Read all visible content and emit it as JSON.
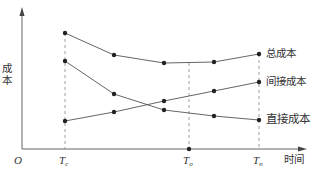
{
  "chart_data": {
    "type": "line",
    "title": "",
    "xlabel": "时间",
    "ylabel": "成本",
    "origin_label": "O",
    "x_ticks": [
      {
        "label": "T",
        "sub": "c",
        "x": 65
      },
      {
        "label": "T",
        "sub": "o",
        "x": 189
      },
      {
        "label": "T",
        "sub": "n",
        "x": 259
      }
    ],
    "grid": false,
    "legend_position": "inline-right",
    "x": [
      65,
      114,
      164,
      214,
      259
    ],
    "series": [
      {
        "name": "总成本",
        "values": [
          141,
          119,
          111,
          112,
          120
        ]
      },
      {
        "name": "间接成本",
        "values": [
          53,
          62,
          73,
          83,
          92
        ]
      },
      {
        "name": "直接成本",
        "values": [
          113,
          80,
          64,
          58,
          54
        ]
      }
    ],
    "pixel_points": {
      "total": [
        [
          65,
          33
        ],
        [
          114,
          55
        ],
        [
          164,
          63
        ],
        [
          214,
          62
        ],
        [
          259,
          54
        ]
      ],
      "indirect": [
        [
          65,
          121
        ],
        [
          114,
          112
        ],
        [
          164,
          101
        ],
        [
          214,
          91
        ],
        [
          259,
          82
        ]
      ],
      "direct": [
        [
          65,
          61
        ],
        [
          114,
          94
        ],
        [
          164,
          110
        ],
        [
          214,
          116
        ],
        [
          259,
          120
        ]
      ]
    }
  },
  "labels": {
    "total": "总成本",
    "indirect": "间接成本",
    "direct": "直接成本",
    "xlabel": "时间",
    "ylabel_chars": [
      "成",
      "本"
    ],
    "origin": "O",
    "tc": {
      "main": "T",
      "sub": "c"
    },
    "to": {
      "main": "T",
      "sub": "o"
    },
    "tn": {
      "main": "T",
      "sub": "n"
    }
  },
  "colors": {
    "line": "#555555",
    "axis": "#666666",
    "dash": "#888888",
    "point": "#222222"
  }
}
